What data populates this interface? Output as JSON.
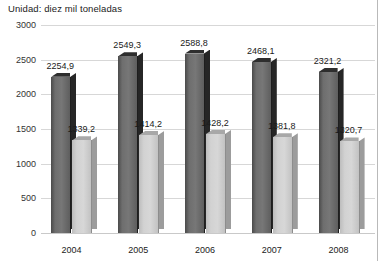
{
  "chart_data": {
    "type": "bar",
    "title": "Unidad: diez mil toneladas",
    "xlabel": "",
    "ylabel": "",
    "ylim": [
      0,
      3000
    ],
    "ytick_step": 500,
    "yticks": [
      "3000",
      "2500",
      "2000",
      "1500",
      "1000",
      "500",
      "0"
    ],
    "grid": true,
    "legend": "none",
    "decimal_separator": ",",
    "categories": [
      "2004",
      "2005",
      "2006",
      "2007",
      "2008"
    ],
    "series": [
      {
        "name": "serie-oscura",
        "color": "#6e6e6e",
        "values": [
          2254.9,
          2549.3,
          2588.8,
          2468.1,
          2321.2
        ],
        "labels": [
          "2254,9",
          "2549,3",
          "2588,8",
          "2468,1",
          "2321,2"
        ]
      },
      {
        "name": "serie-clara",
        "color": "#d2d2d2",
        "values": [
          1339.2,
          1414.2,
          1428.2,
          1381.8,
          1320.7
        ],
        "labels": [
          "1339,2",
          "1414,2",
          "1428,2",
          "1381,8",
          "1320,7"
        ]
      }
    ]
  },
  "colors": {
    "dark_bar": "#6e6e6e",
    "dark_bar_side": "#262626",
    "light_bar": "#d2d2d2",
    "light_bar_side": "#9c9c9c",
    "gridline": "#d7d7d7",
    "frame": "#b9b9b9",
    "text": "#1a1a1a",
    "background": "#ffffff"
  }
}
